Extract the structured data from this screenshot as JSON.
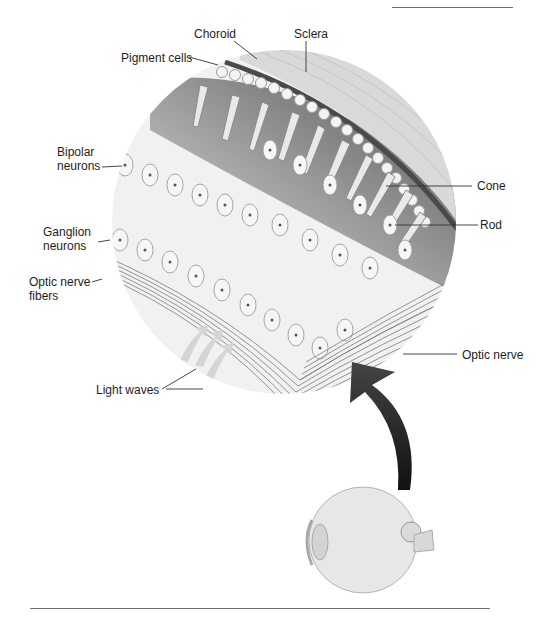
{
  "figure": {
    "labels": {
      "choroid": "Choroid",
      "sclera": "Sclera",
      "pigment_cells": "Pigment cells",
      "bipolar_neurons": "Bipolar\nneurons",
      "bipolar_line1": "Bipolar",
      "bipolar_line2": "neurons",
      "ganglion_line1": "Ganglion",
      "ganglion_line2": "neurons",
      "optic_fibers_line1": "Optic nerve",
      "optic_fibers_line2": "fibers",
      "light_waves": "Light waves",
      "cone": "Cone",
      "rod": "Rod",
      "optic_nerve": "Optic nerve"
    },
    "colors": {
      "background": "#ffffff",
      "text": "#1e1e1e",
      "leader_line": "#333333",
      "rule": "#6f6f6f",
      "arrow": "#2b2b2b",
      "tissue_light": "#e6e6e6",
      "tissue_dark": "#5a5a5a"
    }
  }
}
